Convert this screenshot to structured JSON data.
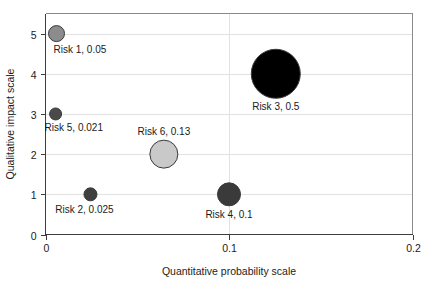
{
  "chart_data": {
    "type": "scatter",
    "title": "",
    "xlabel": "Quantitative probability scale",
    "ylabel": "Qualitative impact scale",
    "xlim": [
      0,
      0.2
    ],
    "ylim": [
      0,
      5.5
    ],
    "xticks": [
      "0",
      "0.1",
      "0.2"
    ],
    "xtick_values": [
      0,
      0.1,
      0.2
    ],
    "yticks": [
      "0",
      "1",
      "2",
      "3",
      "4",
      "5"
    ],
    "ytick_values": [
      0,
      1,
      2,
      3,
      4,
      5
    ],
    "grid": true,
    "legend": "none",
    "bubble_note": "bubble area encodes the probability value shown in each label",
    "points": [
      {
        "name": "Risk 1",
        "label": "Risk 1, 0.05",
        "x": 0.006,
        "y": 5,
        "size": 0.05,
        "radius_px": 8,
        "color": "#8c8c8c",
        "label_dx": -3,
        "label_dy": 19,
        "label_anchor": "start"
      },
      {
        "name": "Risk 5",
        "label": "Risk 5, 0.021",
        "x": 0.0055,
        "y": 3,
        "size": 0.021,
        "radius_px": 6,
        "color": "#4a4a4a",
        "label_dx": -11,
        "label_dy": 17,
        "label_anchor": "start"
      },
      {
        "name": "Risk 6",
        "label": "Risk 6, 0.13",
        "x": 0.0645,
        "y": 2,
        "size": 0.13,
        "radius_px": 14,
        "color": "#c9c9c9",
        "label_dx": 0,
        "label_dy": -19,
        "label_anchor": "middle"
      },
      {
        "name": "Risk 2",
        "label": "Risk 2, 0.025",
        "x": 0.0245,
        "y": 1,
        "size": 0.025,
        "radius_px": 6.5,
        "color": "#3f3f3f",
        "label_dx": -6,
        "label_dy": 19,
        "label_anchor": "middle"
      },
      {
        "name": "Risk 4",
        "label": "Risk 4, 0.1",
        "x": 0.1,
        "y": 1,
        "size": 0.1,
        "radius_px": 11.5,
        "color": "#3a3a3a",
        "label_dx": 0,
        "label_dy": 24,
        "label_anchor": "middle"
      },
      {
        "name": "Risk 3",
        "label": "Risk 3, 0.5",
        "x": 0.1255,
        "y": 4,
        "size": 0.5,
        "radius_px": 24.5,
        "color": "#000000",
        "label_dx": 0,
        "label_dy": 36,
        "label_anchor": "middle"
      }
    ]
  },
  "axes": {
    "x_title": "Quantitative probability scale",
    "y_title": "Qualitative impact scale"
  }
}
